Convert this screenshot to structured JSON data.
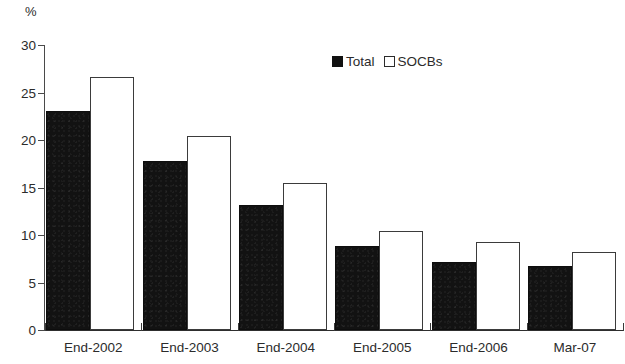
{
  "chart_data": {
    "type": "bar",
    "title": "",
    "subtitle": "",
    "unit_label": "%",
    "xlabel": "",
    "ylabel": "",
    "ylim": [
      0,
      30
    ],
    "yticks": [
      0,
      5,
      10,
      15,
      20,
      25,
      30
    ],
    "ytick_labels": [
      "0",
      "5",
      "10",
      "15",
      "20",
      "25",
      "30"
    ],
    "grid": false,
    "legend_position": "top-center",
    "categories": [
      "End-2002",
      "End-2003",
      "End-2004",
      "End-2005",
      "End-2006",
      "Mar-07"
    ],
    "series": [
      {
        "name": "Total",
        "color": "#111111",
        "style": "filled",
        "values": [
          23.1,
          17.8,
          13.2,
          8.8,
          7.2,
          6.7
        ]
      },
      {
        "name": "SOCBs",
        "color": "#ffffff",
        "style": "hollow",
        "values": [
          26.6,
          20.4,
          15.5,
          10.4,
          9.3,
          8.2
        ]
      }
    ],
    "annotations": []
  },
  "legend": {
    "entries": [
      {
        "label": "Total"
      },
      {
        "label": "SOCBs"
      }
    ]
  }
}
